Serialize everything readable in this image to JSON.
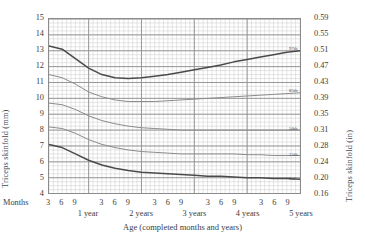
{
  "chart_data": {
    "type": "line",
    "xlabel": "Age (completed months and years)",
    "ylabel": "Triceps skinfold (mm)",
    "ylabel_right": "Triceps skinfold (in)",
    "months_label": "Months",
    "grid": true,
    "legend_position": "right-inline",
    "xlim_months": [
      3,
      60
    ],
    "ylim": [
      4,
      15
    ],
    "y_ticks_mm": [
      4,
      5,
      6,
      7,
      8,
      9,
      10,
      11,
      12,
      13,
      14,
      15
    ],
    "y_ticks_in": [
      "0.16",
      "0.20",
      "0.24",
      "0.28",
      "0.31",
      "0.35",
      "0.39",
      "0.43",
      "0.47",
      "0.51",
      "0.55",
      "0.59"
    ],
    "x_month_ticks": [
      3,
      6,
      9,
      3,
      6,
      9,
      3,
      6,
      9,
      3,
      6,
      9,
      3,
      6,
      9
    ],
    "x_month_tick_positions": [
      3,
      6,
      9,
      15,
      18,
      21,
      27,
      30,
      33,
      39,
      42,
      45,
      51,
      54,
      57
    ],
    "x_year_labels": [
      "1 year",
      "2 years",
      "3 years",
      "4 years",
      "5 years"
    ],
    "x_year_positions": [
      12,
      24,
      36,
      48,
      60
    ],
    "x": [
      3,
      6,
      9,
      12,
      15,
      18,
      21,
      24,
      27,
      30,
      33,
      36,
      39,
      42,
      45,
      48,
      51,
      54,
      57,
      60
    ],
    "series": [
      {
        "name": "97th",
        "color": "#4a4a4a",
        "width": 1.5,
        "values": [
          13.3,
          13.1,
          12.5,
          11.9,
          11.5,
          11.3,
          11.25,
          11.3,
          11.4,
          11.5,
          11.65,
          11.8,
          11.95,
          12.1,
          12.3,
          12.45,
          12.6,
          12.75,
          12.9,
          13.0
        ]
      },
      {
        "name": "85th",
        "color": "#8a8a8a",
        "width": 1.0,
        "values": [
          11.5,
          11.3,
          10.9,
          10.4,
          10.1,
          9.9,
          9.8,
          9.8,
          9.8,
          9.85,
          9.9,
          9.95,
          10.0,
          10.05,
          10.1,
          10.15,
          10.2,
          10.25,
          10.3,
          10.35
        ]
      },
      {
        "name": "50th",
        "color": "#8a8a8a",
        "width": 1.0,
        "values": [
          9.7,
          9.6,
          9.3,
          8.9,
          8.6,
          8.4,
          8.25,
          8.15,
          8.1,
          8.05,
          8.0,
          8.0,
          8.0,
          8.0,
          8.0,
          8.0,
          8.0,
          8.0,
          8.0,
          8.0
        ]
      },
      {
        "name": "15th",
        "color": "#8a8a8a",
        "width": 1.0,
        "values": [
          8.2,
          8.1,
          7.8,
          7.4,
          7.1,
          6.9,
          6.75,
          6.65,
          6.6,
          6.55,
          6.5,
          6.5,
          6.5,
          6.5,
          6.5,
          6.45,
          6.45,
          6.4,
          6.4,
          6.4
        ]
      },
      {
        "name": "3rd",
        "color": "#4a4a4a",
        "width": 1.5,
        "values": [
          7.1,
          6.9,
          6.5,
          6.1,
          5.8,
          5.6,
          5.45,
          5.35,
          5.3,
          5.25,
          5.2,
          5.15,
          5.1,
          5.1,
          5.05,
          5.0,
          5.0,
          4.95,
          4.95,
          4.9
        ]
      }
    ]
  }
}
